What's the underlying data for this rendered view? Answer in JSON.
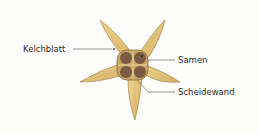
{
  "diagram": {
    "labels": {
      "kelchblatt": "Kelchblatt",
      "samen": "Samen",
      "scheidewand": "Scheidewand"
    },
    "colors": {
      "background": "#fdfdfb",
      "petal_fill": "#e2c47a",
      "petal_outline": "#a8874a",
      "seed": "#7a5a44",
      "capsule": "#c9a563",
      "leader_line": "#555555",
      "text": "#2b2b2b"
    }
  }
}
